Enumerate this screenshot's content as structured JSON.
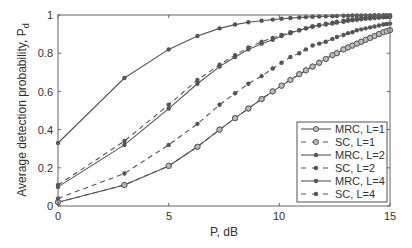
{
  "chart_data": {
    "type": "line",
    "title": "",
    "xlabel": "P, dB",
    "ylabel": "Average detection probability, P_d",
    "xlim": [
      0,
      15
    ],
    "ylim": [
      0,
      1
    ],
    "xticks": [
      0,
      5,
      10,
      15
    ],
    "yticks": [
      0,
      0.2,
      0.4,
      0.6,
      0.8,
      1
    ],
    "grid": false,
    "legend_position": "lower right",
    "x": [
      0,
      3,
      5,
      6.3,
      7.3,
      8,
      8.6,
      9.2,
      9.7,
      10.1,
      10.5,
      10.9,
      11.2,
      11.5,
      11.8,
      12.1,
      12.4,
      12.6,
      12.9,
      13.1,
      13.3,
      13.5,
      13.7,
      13.9,
      14.1,
      14.3,
      14.5,
      14.7,
      14.85,
      15
    ],
    "series": [
      {
        "name": "MRC, L=1",
        "style": "solid",
        "marker": "open-circle",
        "values": [
          0.02,
          0.11,
          0.21,
          0.31,
          0.4,
          0.46,
          0.51,
          0.56,
          0.6,
          0.63,
          0.66,
          0.69,
          0.71,
          0.73,
          0.75,
          0.77,
          0.79,
          0.8,
          0.82,
          0.83,
          0.84,
          0.85,
          0.86,
          0.87,
          0.88,
          0.89,
          0.9,
          0.91,
          0.915,
          0.92
        ]
      },
      {
        "name": "SC, L=1",
        "style": "dashed",
        "marker": "open-circle",
        "values": [
          0.02,
          0.11,
          0.21,
          0.31,
          0.4,
          0.46,
          0.51,
          0.56,
          0.6,
          0.63,
          0.66,
          0.69,
          0.71,
          0.73,
          0.75,
          0.77,
          0.79,
          0.8,
          0.82,
          0.83,
          0.84,
          0.85,
          0.86,
          0.87,
          0.88,
          0.89,
          0.9,
          0.91,
          0.915,
          0.92
        ]
      },
      {
        "name": "MRC, L=2",
        "style": "solid",
        "marker": "dot",
        "values": [
          0.1,
          0.32,
          0.51,
          0.64,
          0.73,
          0.78,
          0.82,
          0.85,
          0.87,
          0.89,
          0.905,
          0.92,
          0.93,
          0.94,
          0.945,
          0.95,
          0.955,
          0.96,
          0.965,
          0.97,
          0.972,
          0.975,
          0.978,
          0.98,
          0.982,
          0.984,
          0.986,
          0.988,
          0.989,
          0.99
        ]
      },
      {
        "name": "SC, L=2",
        "style": "dashed",
        "marker": "dot",
        "values": [
          0.04,
          0.17,
          0.32,
          0.43,
          0.53,
          0.59,
          0.64,
          0.68,
          0.72,
          0.75,
          0.78,
          0.8,
          0.82,
          0.84,
          0.85,
          0.86,
          0.875,
          0.885,
          0.895,
          0.905,
          0.91,
          0.92,
          0.925,
          0.93,
          0.935,
          0.94,
          0.945,
          0.95,
          0.953,
          0.955
        ]
      },
      {
        "name": "MRC, L=4",
        "style": "solid",
        "marker": "dot",
        "values": [
          0.33,
          0.67,
          0.82,
          0.89,
          0.93,
          0.95,
          0.962,
          0.97,
          0.976,
          0.98,
          0.984,
          0.987,
          0.989,
          0.991,
          0.992,
          0.993,
          0.994,
          0.995,
          0.996,
          0.996,
          0.997,
          0.997,
          0.998,
          0.998,
          0.998,
          0.999,
          0.999,
          0.999,
          0.999,
          0.999
        ]
      },
      {
        "name": "SC, L=4",
        "style": "dashed",
        "marker": "dot",
        "values": [
          0.11,
          0.34,
          0.53,
          0.66,
          0.74,
          0.79,
          0.83,
          0.86,
          0.88,
          0.895,
          0.91,
          0.92,
          0.93,
          0.94,
          0.948,
          0.955,
          0.96,
          0.965,
          0.97,
          0.974,
          0.977,
          0.98,
          0.983,
          0.985,
          0.987,
          0.989,
          0.99,
          0.991,
          0.992,
          0.993
        ]
      }
    ]
  },
  "axes": {
    "xlabel": "P, dB",
    "ylabel_main": "Average detection probability, P",
    "ylabel_sub": "d",
    "xtick_labels": [
      "0",
      "5",
      "10",
      "15"
    ],
    "ytick_labels": [
      "0",
      "0.2",
      "0.4",
      "0.6",
      "0.8",
      "1"
    ]
  },
  "legend": {
    "items": [
      "MRC, L=1",
      "SC, L=1",
      "MRC, L=2",
      "SC, L=2",
      "MRC, L=4",
      "SC, L=4"
    ]
  },
  "colors": {
    "line": "#555555",
    "axis": "#666666",
    "text": "#333333"
  }
}
